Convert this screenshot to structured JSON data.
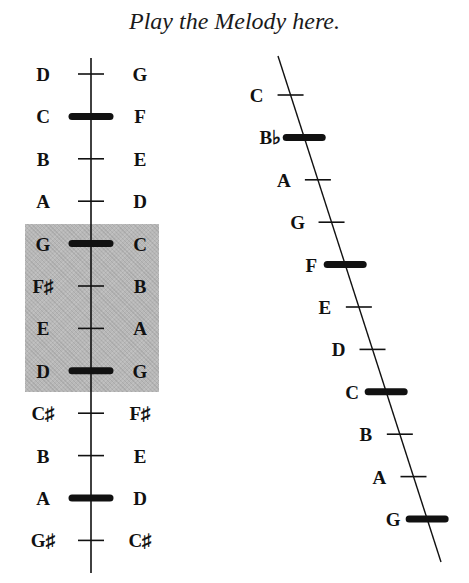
{
  "title": "Play the Melody here.",
  "left_scale": {
    "highlight_range": {
      "from_row": 4,
      "to_row": 7
    },
    "rows": [
      {
        "left": "D",
        "right": "G",
        "marker": "tick"
      },
      {
        "left": "C",
        "right": "F",
        "marker": "bar"
      },
      {
        "left": "B",
        "right": "E",
        "marker": "tick"
      },
      {
        "left": "A",
        "right": "D",
        "marker": "tick"
      },
      {
        "left": "G",
        "right": "C",
        "marker": "bar"
      },
      {
        "left": "F♯",
        "right": "B",
        "marker": "tick"
      },
      {
        "left": "E",
        "right": "A",
        "marker": "tick"
      },
      {
        "left": "D",
        "right": "G",
        "marker": "bar"
      },
      {
        "left": "C♯",
        "right": "F♯",
        "marker": "tick"
      },
      {
        "left": "B",
        "right": "E",
        "marker": "tick"
      },
      {
        "left": "A",
        "right": "D",
        "marker": "bar"
      },
      {
        "left": "G♯",
        "right": "C♯",
        "marker": "tick"
      }
    ]
  },
  "right_scale": {
    "rows": [
      {
        "label": "C",
        "marker": "tick"
      },
      {
        "label": "B♭",
        "marker": "bar"
      },
      {
        "label": "A",
        "marker": "tick"
      },
      {
        "label": "G",
        "marker": "tick"
      },
      {
        "label": "F",
        "marker": "bar"
      },
      {
        "label": "E",
        "marker": "tick"
      },
      {
        "label": "D",
        "marker": "tick"
      },
      {
        "label": "C",
        "marker": "bar"
      },
      {
        "label": "B",
        "marker": "tick"
      },
      {
        "label": "A",
        "marker": "tick"
      },
      {
        "label": "G",
        "marker": "bar"
      }
    ]
  },
  "colors": {
    "ink": "#111111",
    "shade": "#b8b8b8"
  }
}
